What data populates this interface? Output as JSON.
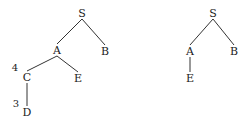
{
  "trees": [
    {
      "name": "left-tree",
      "nodes": [
        {
          "id": "S",
          "label": "S",
          "x": 82,
          "y": 13
        },
        {
          "id": "A",
          "label": "A",
          "x": 57,
          "y": 50
        },
        {
          "id": "B",
          "label": "B",
          "x": 105,
          "y": 51
        },
        {
          "id": "C",
          "label": "C",
          "x": 27,
          "y": 77
        },
        {
          "id": "E",
          "label": "E",
          "x": 78,
          "y": 78
        },
        {
          "id": "D",
          "label": "D",
          "x": 27,
          "y": 112
        }
      ],
      "edges": [
        [
          "S",
          "A"
        ],
        [
          "S",
          "B"
        ],
        [
          "A",
          "C"
        ],
        [
          "A",
          "E"
        ],
        [
          "C",
          "D"
        ]
      ],
      "annotations": [
        {
          "label": "4",
          "x": 15,
          "y": 68
        },
        {
          "label": "3",
          "x": 16,
          "y": 104
        }
      ]
    },
    {
      "name": "right-tree",
      "nodes": [
        {
          "id": "S",
          "label": "S",
          "x": 213,
          "y": 13
        },
        {
          "id": "A",
          "label": "A",
          "x": 190,
          "y": 51
        },
        {
          "id": "B",
          "label": "B",
          "x": 234,
          "y": 51
        },
        {
          "id": "E",
          "label": "E",
          "x": 190,
          "y": 78
        }
      ],
      "edges": [
        [
          "S",
          "A"
        ],
        [
          "S",
          "B"
        ],
        [
          "A",
          "E"
        ]
      ],
      "annotations": []
    }
  ],
  "colors": {
    "line": "#333333",
    "text": "#222222"
  }
}
